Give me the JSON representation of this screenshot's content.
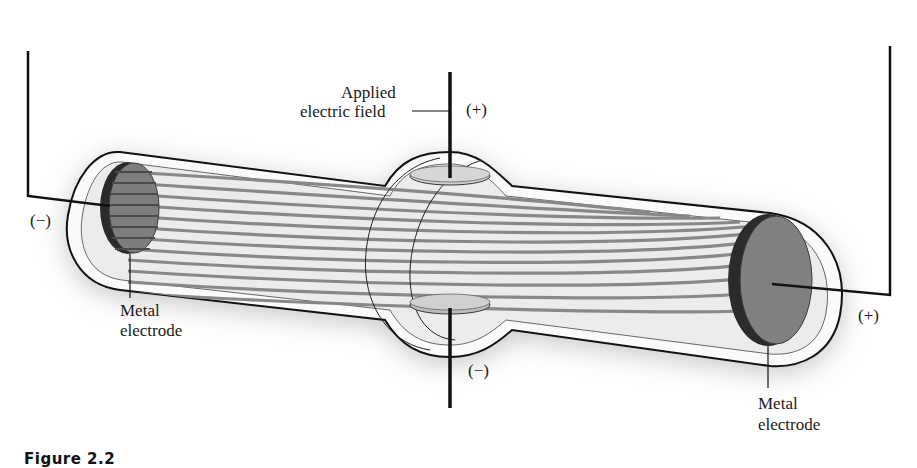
{
  "figure": {
    "caption": "Figure 2.2"
  },
  "labels": {
    "applied_field_line1": "Applied",
    "applied_field_line2": "electric field",
    "top_plate_polarity": "(+)",
    "bottom_plate_polarity": "(−)",
    "left_terminal_polarity": "(−)",
    "right_terminal_polarity": "(+)",
    "left_electrode_line1": "Metal",
    "left_electrode_line2": "electrode",
    "right_electrode_line1": "Metal",
    "right_electrode_line2": "electrode"
  },
  "colors": {
    "outline": "#111111",
    "tube_fill": "#ededed",
    "tube_rim": "#fafafa",
    "shadow": "#cfcfcf",
    "electrode_face": "#7d7d7d",
    "electrode_edge": "#2b2b2b",
    "beam": "#8a8a8a",
    "plate": "#cccccc"
  },
  "beam": {
    "line_count": 12
  }
}
